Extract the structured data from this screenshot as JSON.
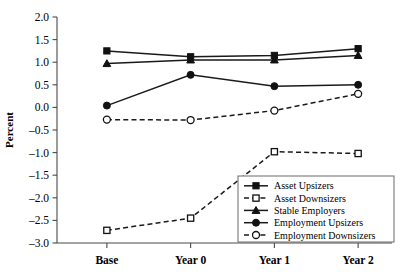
{
  "chart_data": {
    "type": "line",
    "title": "",
    "xlabel": "",
    "ylabel": "Percent",
    "categories": [
      "Base",
      "Year 0",
      "Year 1",
      "Year 2"
    ],
    "ylim": [
      -3.0,
      2.0
    ],
    "yticks": [
      2.0,
      1.5,
      1.0,
      0.5,
      0.0,
      -0.5,
      -1.0,
      -1.5,
      -2.0,
      -2.5,
      -3.0
    ],
    "ytick_labels": [
      "2.0",
      "1.5",
      "1.0",
      "0.5",
      "0.0",
      "-0.5",
      "-1.0",
      "-1.5",
      "-2.0",
      "-2.5",
      "-3.0"
    ],
    "grid": false,
    "legend_position": "lower right",
    "series": [
      {
        "name": "Asset Upsizers",
        "marker": "filled-square",
        "line_style": "solid",
        "values": [
          1.25,
          1.12,
          1.15,
          1.3
        ]
      },
      {
        "name": "Asset Downsizers",
        "marker": "open-square",
        "line_style": "dashed",
        "values": [
          -2.72,
          -2.45,
          -0.98,
          -1.02
        ]
      },
      {
        "name": "Stable Employers",
        "marker": "filled-triangle",
        "line_style": "solid",
        "values": [
          0.97,
          1.05,
          1.05,
          1.15
        ]
      },
      {
        "name": "Employment Upsizers",
        "marker": "filled-circle",
        "line_style": "solid",
        "values": [
          0.04,
          0.72,
          0.47,
          0.5
        ]
      },
      {
        "name": "Employment Downsizers",
        "marker": "open-circle",
        "line_style": "dashed",
        "values": [
          -0.27,
          -0.28,
          -0.07,
          0.3
        ]
      }
    ]
  }
}
